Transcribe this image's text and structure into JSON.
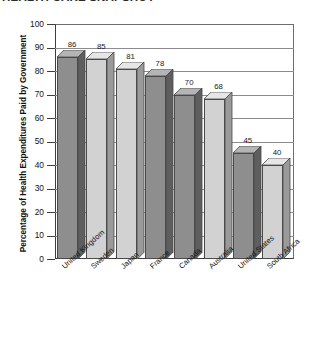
{
  "chart_data": {
    "type": "bar",
    "title": "HEALTH CARE SNAPSHOT",
    "xlabel": "",
    "ylabel": "Percentage of Health Expenditures Paid by Government",
    "ylim": [
      0,
      100
    ],
    "ytick_values": [
      100,
      90,
      80,
      70,
      60,
      50,
      40,
      30,
      20,
      10,
      0
    ],
    "ytick_labels": [
      "100",
      "90",
      "80",
      "70",
      "60",
      "50",
      "40",
      "30",
      "20",
      "10",
      "0"
    ],
    "grid": true,
    "legend": "none",
    "three_d": true,
    "categories": [
      "United Kingdom",
      "Sweden",
      "Japan",
      "France",
      "Canada",
      "Australia",
      "United States",
      "South Africa"
    ],
    "values": [
      86,
      85,
      81,
      78,
      70,
      68,
      45,
      40
    ],
    "value_labels": [
      "86",
      "85",
      "81",
      "78",
      "70",
      "68",
      "45",
      "40"
    ],
    "bar_colors": [
      "#8e8e8e",
      "#d2d2d2",
      "#d2d2d2",
      "#8e8e8e",
      "#8e8e8e",
      "#d2d2d2",
      "#8e8e8e",
      "#d2d2d2"
    ],
    "bar_side_colors": [
      "#5e5e5e",
      "#9a9a9a",
      "#9a9a9a",
      "#5e5e5e",
      "#5e5e5e",
      "#9a9a9a",
      "#5e5e5e",
      "#9a9a9a"
    ],
    "bar_top_colors": [
      "#b4b4b4",
      "#e6e6e6",
      "#e6e6e6",
      "#b4b4b4",
      "#b4b4b4",
      "#e6e6e6",
      "#b4b4b4",
      "#e6e6e6"
    ],
    "axis_color": "#3d3d3d",
    "grid_color": "#8c8c8c",
    "background": "#ffffff"
  }
}
